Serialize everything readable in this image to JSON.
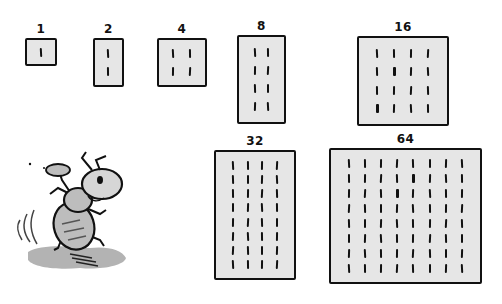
{
  "colors": {
    "box_fill": "#e6e6e6",
    "ink": "#111111",
    "ant_gray": "#bdbdbd",
    "shadow": "#9a9a9a"
  },
  "boxes": [
    {
      "label": "1",
      "count": 1,
      "cols": 1,
      "rows": 1,
      "x": 25,
      "y": 38,
      "w": 32,
      "h": 28
    },
    {
      "label": "2",
      "count": 2,
      "cols": 1,
      "rows": 2,
      "x": 93,
      "y": 38,
      "w": 31,
      "h": 49
    },
    {
      "label": "4",
      "count": 4,
      "cols": 2,
      "rows": 2,
      "x": 157,
      "y": 38,
      "w": 50,
      "h": 49
    },
    {
      "label": "8",
      "count": 8,
      "cols": 2,
      "rows": 4,
      "x": 237,
      "y": 35,
      "w": 49,
      "h": 89
    },
    {
      "label": "16",
      "count": 16,
      "cols": 4,
      "rows": 4,
      "x": 357,
      "y": 36,
      "w": 92,
      "h": 90
    },
    {
      "label": "32",
      "count": 32,
      "cols": 4,
      "rows": 8,
      "x": 214,
      "y": 150,
      "w": 82,
      "h": 130
    },
    {
      "label": "64",
      "count": 64,
      "cols": 8,
      "rows": 8,
      "x": 329,
      "y": 148,
      "w": 153,
      "h": 136
    }
  ],
  "illustration": {
    "subject": "ant-carrying-pebble",
    "position": "bottom-left"
  }
}
